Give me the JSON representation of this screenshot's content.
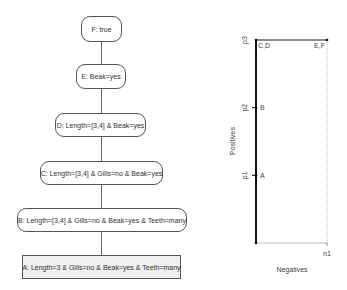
{
  "lattice": {
    "nodes": [
      {
        "id": "F",
        "label": "F: true"
      },
      {
        "id": "E",
        "label": "E: Beak=yes"
      },
      {
        "id": "D",
        "label": "D: Length=[3,4] & Beak=yes"
      },
      {
        "id": "C",
        "label": "C: Length=[3,4] & Gills=no & Beak=yes"
      },
      {
        "id": "B",
        "label": "B: Length=[3,4] & Gills=no & Beak=yes & Teeth=many"
      },
      {
        "id": "A",
        "label": "A: Length=3 & Gills=no & Beak=yes & Teeth=many"
      }
    ],
    "edges": [
      [
        "F",
        "E"
      ],
      [
        "E",
        "D"
      ],
      [
        "D",
        "C"
      ],
      [
        "C",
        "B"
      ],
      [
        "B",
        "A"
      ]
    ]
  },
  "coverage_plot": {
    "xlabel": "Negatives",
    "ylabel": "Positives",
    "x_ticks": [
      "n1"
    ],
    "y_ticks": [
      "p1",
      "p2",
      "p3"
    ],
    "points": [
      {
        "label": "A",
        "neg": 0,
        "pos": 1
      },
      {
        "label": "B",
        "neg": 0,
        "pos": 2
      },
      {
        "label": "C,D",
        "neg": 0,
        "pos": 3
      },
      {
        "label": "E,F",
        "neg": 1,
        "pos": 3
      }
    ],
    "path": [
      "A",
      "B",
      "C,D",
      "E,F"
    ],
    "x_range": [
      0,
      1
    ],
    "y_range": [
      0,
      3
    ]
  }
}
